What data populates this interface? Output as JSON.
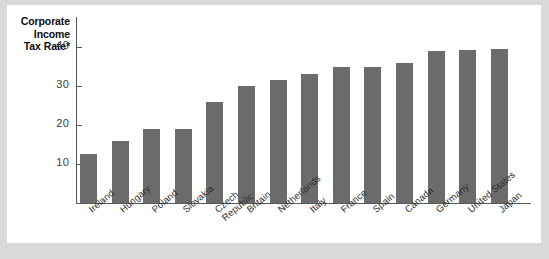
{
  "chart_data": {
    "type": "bar",
    "title_lines": [
      "Corporate",
      "Income",
      "Tax Rate*"
    ],
    "xlabel": "",
    "ylabel": "Corporate Income Tax Rate*",
    "ylim": [
      0,
      44
    ],
    "yticks": [
      10,
      20,
      30,
      40
    ],
    "grid": false,
    "legend": null,
    "bar_color": "#6b6b6b",
    "categories": [
      "Ireland",
      "Hungary",
      "Poland",
      "Slovakia",
      "Czech Republic",
      "Britain",
      "Netherlands",
      "Italy",
      "France",
      "Spain",
      "Canada",
      "Germany",
      "United States",
      "Japan"
    ],
    "values": [
      12.5,
      16,
      19,
      19,
      26,
      30,
      31.5,
      33,
      35,
      35,
      36,
      38.9,
      39.3,
      39.5
    ]
  },
  "axis": {
    "title_lines": [
      "Corporate",
      "Income",
      "Tax Rate*"
    ],
    "ticks": [
      "40",
      "30",
      "20",
      "10"
    ]
  },
  "bars": [
    {
      "label": "Ireland",
      "label_line2": "",
      "value": 12.5
    },
    {
      "label": "Hungary",
      "label_line2": "",
      "value": 16
    },
    {
      "label": "Poland",
      "label_line2": "",
      "value": 19
    },
    {
      "label": "Slovakia",
      "label_line2": "",
      "value": 19
    },
    {
      "label": "Czech",
      "label_line2": "Republic",
      "value": 26
    },
    {
      "label": "Britain",
      "label_line2": "",
      "value": 30
    },
    {
      "label": "Netherlands",
      "label_line2": "",
      "value": 31.5
    },
    {
      "label": "Italy",
      "label_line2": "",
      "value": 33
    },
    {
      "label": "France",
      "label_line2": "",
      "value": 35
    },
    {
      "label": "Spain",
      "label_line2": "",
      "value": 35
    },
    {
      "label": "Canada",
      "label_line2": "",
      "value": 36
    },
    {
      "label": "Germany",
      "label_line2": "",
      "value": 38.9
    },
    {
      "label": "United States",
      "label_line2": "",
      "value": 39.3
    },
    {
      "label": "Japan",
      "label_line2": "",
      "value": 39.5
    }
  ],
  "colors": {
    "bar": "#6b6b6b",
    "axis": "#59595b",
    "page_border": "#d9d9d9",
    "plot_background": "#ffffff"
  }
}
